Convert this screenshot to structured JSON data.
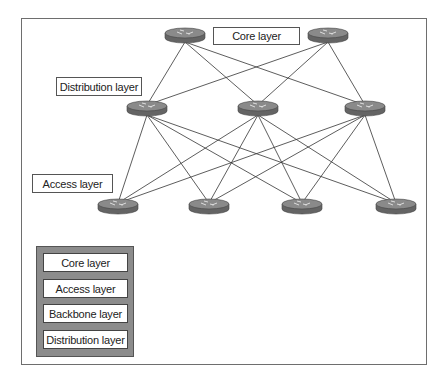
{
  "diagram": {
    "labels": {
      "core": "Core layer",
      "distribution": "Distribution layer",
      "access": "Access layer"
    },
    "routers": {
      "core": [
        {
          "x": 185,
          "y": 35
        },
        {
          "x": 328,
          "y": 35
        }
      ],
      "distribution": [
        {
          "x": 147,
          "y": 108
        },
        {
          "x": 258,
          "y": 108
        },
        {
          "x": 365,
          "y": 108
        }
      ],
      "access": [
        {
          "x": 118,
          "y": 206
        },
        {
          "x": 209,
          "y": 206
        },
        {
          "x": 302,
          "y": 206
        },
        {
          "x": 396,
          "y": 206
        }
      ]
    },
    "connections": "full mesh core-to-distribution and distribution-to-access",
    "colors": {
      "router_top": "#8a8a8a",
      "router_side": "#646464",
      "line": "#333333",
      "legend_bg": "#8c8c8c"
    }
  },
  "legend": {
    "options": [
      {
        "label": "Core layer"
      },
      {
        "label": "Access layer"
      },
      {
        "label": "Backbone layer"
      },
      {
        "label": "Distribution layer"
      }
    ]
  }
}
